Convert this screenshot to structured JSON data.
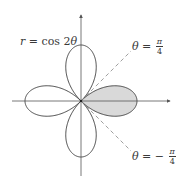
{
  "figure": {
    "curve_label": {
      "r": "r",
      "eq": " = cos 2",
      "theta": "θ"
    },
    "line_upper_label": {
      "theta": "θ",
      "eq": " = ",
      "num": "π",
      "den": "4"
    },
    "line_lower_label": {
      "theta": "θ",
      "eq": " = − ",
      "num": "π",
      "den": "4"
    },
    "colors": {
      "stroke": "#444444",
      "axis": "#555555",
      "dash": "#888888",
      "shade": "#d9d9d9"
    }
  },
  "chart_data": {
    "type": "polar-curve",
    "title": "r = cos 2θ",
    "equation": "r = cos(2θ)",
    "curve": "four-leaved rose",
    "petals": 4,
    "petal_directions_deg": [
      0,
      90,
      180,
      270
    ],
    "shaded_region": {
      "description": "right petal, bounded by θ = -π/4 to θ = π/4",
      "theta_range": [
        "-π/4",
        "π/4"
      ]
    },
    "reference_lines": [
      {
        "label": "θ = π/4",
        "style": "dashed",
        "angle_deg": 45
      },
      {
        "label": "θ = −π/4",
        "style": "dashed",
        "angle_deg": -45
      }
    ],
    "axes": {
      "x": "horizontal with arrow",
      "y": "vertical with arrow",
      "ticks": "none"
    },
    "grid": false
  }
}
